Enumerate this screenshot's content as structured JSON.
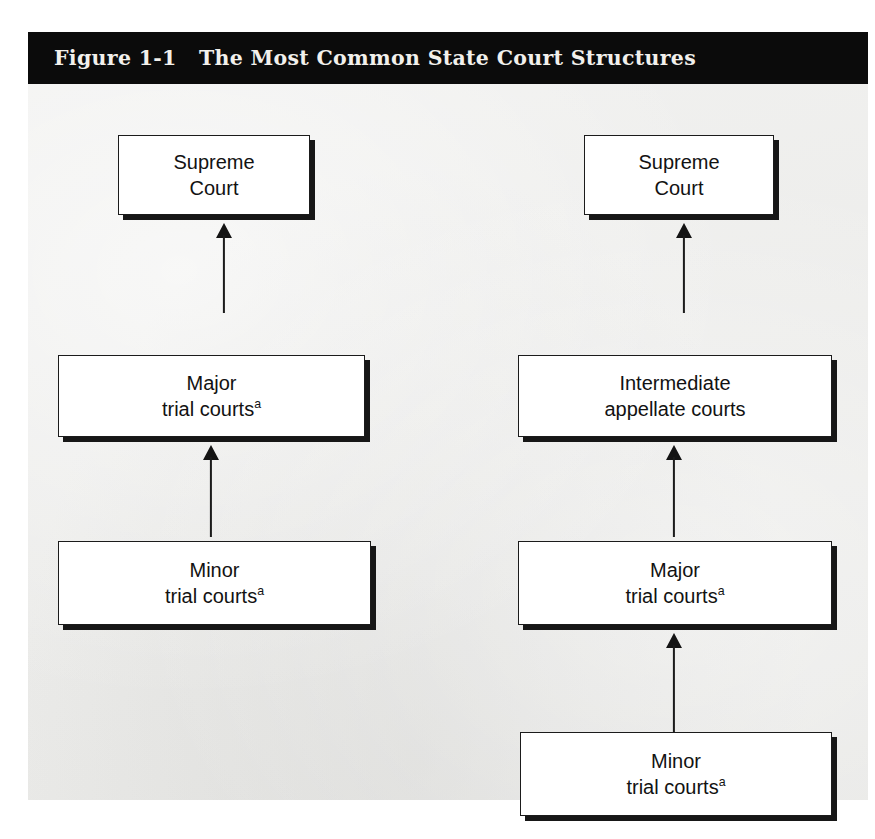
{
  "figure": {
    "label": "Figure 1-1",
    "title": "The Most Common State Court Structures",
    "title_full": "Figure 1-1   The Most Common State Court Structures",
    "colors": {
      "title_bar_background": "#0b0b0b",
      "title_text": "#f2f0ec",
      "panel_background": "#ebebe9",
      "box_fill": "#ffffff",
      "box_border": "#1b1b1b",
      "box_shadow": "#171717",
      "arrow": "#1b1b1b"
    }
  },
  "diagram": {
    "type": "hierarchy",
    "columns": [
      {
        "name": "three-tier-structure",
        "boxes": [
          {
            "id": "left-supreme-court",
            "line1": "Supreme",
            "line2": "Court",
            "superscript": ""
          },
          {
            "id": "left-major-trial",
            "line1": "Major",
            "line2": "trial courts",
            "superscript": "a"
          },
          {
            "id": "left-minor-trial",
            "line1": "Minor",
            "line2": "trial courts",
            "superscript": "a"
          }
        ],
        "arrows": [
          {
            "id": "left-arrow-minor-to-major",
            "from": "left-minor-trial",
            "to": "left-major-trial",
            "direction": "up"
          },
          {
            "id": "left-arrow-major-to-supreme",
            "from": "left-major-trial",
            "to": "left-supreme-court",
            "direction": "up"
          }
        ]
      },
      {
        "name": "four-tier-structure",
        "boxes": [
          {
            "id": "right-supreme-court",
            "line1": "Supreme",
            "line2": "Court",
            "superscript": ""
          },
          {
            "id": "right-intermediate-court",
            "line1": "Intermediate",
            "line2": "appellate courts",
            "superscript": ""
          },
          {
            "id": "right-major-trial",
            "line1": "Major",
            "line2": "trial courts",
            "superscript": "a"
          },
          {
            "id": "right-minor-trial",
            "line1": "Minor",
            "line2": "trial courts",
            "superscript": "a"
          }
        ],
        "arrows": [
          {
            "id": "right-arrow-minor-to-major",
            "from": "right-minor-trial",
            "to": "right-major-trial",
            "direction": "up"
          },
          {
            "id": "right-arrow-major-to-intermediate",
            "from": "right-major-trial",
            "to": "right-intermediate-court",
            "direction": "up"
          },
          {
            "id": "right-arrow-intermediate-to-supreme",
            "from": "right-intermediate-court",
            "to": "right-supreme-court",
            "direction": "up"
          }
        ]
      }
    ]
  }
}
